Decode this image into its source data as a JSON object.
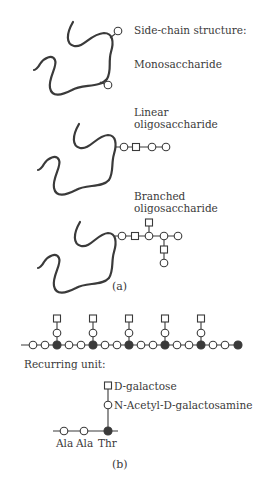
{
  "panel_a": {
    "heading": "Side-chain structure:",
    "labels": {
      "monosaccharide": "Monosaccharide",
      "linear_line1": "Linear",
      "linear_line2": "oligosaccharide",
      "branched_line1": "Branched",
      "branched_line2": "oligosaccharide"
    },
    "caption": "(a)"
  },
  "panel_b": {
    "recurring_label": "Recurring unit:",
    "galactose_prefix": "D",
    "galactose_label": "-galactose",
    "nacetyl_prefix": "N-Acetyl-",
    "nacetyl_d": "D",
    "nacetyl_suffix": "-galactosamine",
    "residues": [
      "Ala",
      "Ala",
      "Thr"
    ],
    "caption": "(b)",
    "repeat_count": 5
  },
  "legend": {
    "open_circle": "hexose / amino acid residue",
    "square": "sugar residue",
    "filled_circle": "Thr residue"
  },
  "colors": {
    "ink": "#3a3a3a",
    "background": "#ffffff"
  }
}
